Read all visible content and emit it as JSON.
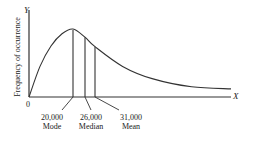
{
  "chart_data": {
    "type": "line",
    "title": "",
    "xlabel": "X",
    "ylabel": "Frequency of occurrence",
    "y_axis_letter": "Y",
    "origin_label": "0",
    "curve_points": [
      {
        "x": 0,
        "y": 0
      },
      {
        "x": 5000,
        "y": 0.45
      },
      {
        "x": 10000,
        "y": 0.75
      },
      {
        "x": 15000,
        "y": 0.93
      },
      {
        "x": 20000,
        "y": 1.0
      },
      {
        "x": 26000,
        "y": 0.88
      },
      {
        "x": 31000,
        "y": 0.74
      },
      {
        "x": 45000,
        "y": 0.45
      },
      {
        "x": 60000,
        "y": 0.27
      },
      {
        "x": 80000,
        "y": 0.15
      },
      {
        "x": 100000,
        "y": 0.12
      }
    ],
    "markers": [
      {
        "name": "Mode",
        "value": 20000,
        "label": "20,000"
      },
      {
        "name": "Median",
        "value": 26000,
        "label": "26,000"
      },
      {
        "name": "Mean",
        "value": 31000,
        "label": "31,000"
      }
    ],
    "xlim": [
      0,
      100000
    ],
    "ylim": [
      0,
      1.25
    ],
    "grid": false,
    "legend": "none"
  }
}
